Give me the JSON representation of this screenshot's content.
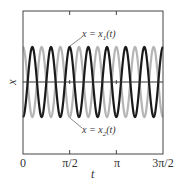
{
  "chart_data": {
    "type": "line",
    "title": "",
    "xlabel": "t",
    "ylabel": "x",
    "xlim": [
      0,
      4.712389
    ],
    "ylim": [
      -1.5,
      1.5
    ],
    "grid": false,
    "legend": "none (inline annotations)",
    "x_ticks": [
      {
        "value": 0,
        "label": "0"
      },
      {
        "value": 1.570796,
        "label": "π/2"
      },
      {
        "value": 3.141593,
        "label": "π"
      },
      {
        "value": 4.712389,
        "label": "3π/2"
      }
    ],
    "zero_line": true,
    "series": [
      {
        "name": "x = x1(t)",
        "color": "#1a1a1a",
        "stroke_width": 2.2,
        "description": "sinusoid, amplitude 1, ~7.5 cycles across range, starts at trough",
        "amplitude": 1,
        "cycles": 7.5,
        "phase_start": "trough"
      },
      {
        "name": "x = x2(t)",
        "color": "#b5b5b5",
        "stroke_width": 2.2,
        "description": "sinusoid, amplitude 1, same frequency, anti-phase to x1 (starts at peak)",
        "amplitude": 1,
        "cycles": 7.5,
        "phase_start": "peak"
      }
    ],
    "annotations": [
      {
        "text": "x = x1(t)",
        "points_to": "x1 peak near t≈π/2"
      },
      {
        "text": "x = x2(t)",
        "points_to": "x2 trough near t≈π/2"
      }
    ]
  },
  "labels": {
    "ylabel": "x",
    "xlabel": "t",
    "ticks": [
      "0",
      "π/2",
      "π",
      "3π/2"
    ],
    "ann1_lhs": "x = x",
    "ann1_sub": "1",
    "ann1_rhs": "(t)",
    "ann2_lhs": "x = x",
    "ann2_sub": "2",
    "ann2_rhs": "(t)"
  }
}
